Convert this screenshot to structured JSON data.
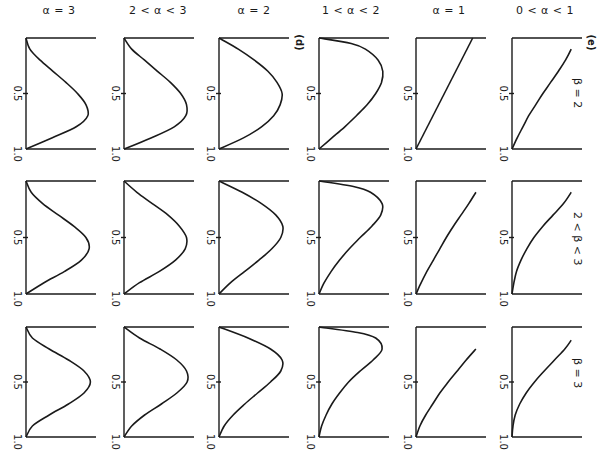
{
  "figure": {
    "panel_tags": {
      "d": "(d)",
      "e": "(e)"
    },
    "column_titles": [
      "α = 3",
      "2 < α < 3",
      "α = 2",
      "1 < α < 2",
      "α = 1",
      "0 < α < 1"
    ],
    "row_labels": [
      "β = 2",
      "2 < β < 3",
      "β = 3"
    ],
    "tick_labels": {
      "mid": "0.5",
      "end": "1.0"
    }
  },
  "chart_data": {
    "type": "line",
    "title": "",
    "xlabel": "",
    "ylabel": "",
    "axis_range": [
      0,
      1
    ],
    "axis_ticks": [
      0.5,
      1.0
    ],
    "grid": false,
    "columns": [
      "α = 3",
      "2 < α < 3",
      "α = 2",
      "1 < α < 2",
      "α = 1",
      "0 < α < 1"
    ],
    "rows": [
      "β = 2",
      "2 < β < 3",
      "β = 3"
    ],
    "panels": [
      {
        "row": "β = 2",
        "col": "α = 3",
        "t": [
          0,
          0.1,
          0.2,
          0.3,
          0.4,
          0.5,
          0.6,
          0.7,
          0.8,
          0.9,
          1.0
        ],
        "value": [
          0,
          0.06,
          0.22,
          0.42,
          0.62,
          0.8,
          0.93,
          0.96,
          0.78,
          0.4,
          0
        ]
      },
      {
        "row": "β = 2",
        "col": "2 < α < 3",
        "t": [
          0,
          0.1,
          0.2,
          0.3,
          0.4,
          0.5,
          0.6,
          0.7,
          0.8,
          0.9,
          1.0
        ],
        "value": [
          0,
          0.12,
          0.32,
          0.52,
          0.72,
          0.88,
          0.97,
          0.96,
          0.78,
          0.42,
          0
        ]
      },
      {
        "row": "β = 2",
        "col": "α = 2",
        "t": [
          0,
          0.1,
          0.2,
          0.3,
          0.4,
          0.5,
          0.6,
          0.7,
          0.8,
          0.9,
          1.0
        ],
        "value": [
          0,
          0.3,
          0.55,
          0.76,
          0.9,
          0.98,
          0.95,
          0.85,
          0.66,
          0.38,
          0
        ]
      },
      {
        "row": "β = 2",
        "col": "1 < α < 2",
        "t": [
          0,
          0.05,
          0.1,
          0.2,
          0.3,
          0.4,
          0.5,
          0.6,
          0.7,
          0.8,
          0.9,
          1.0
        ],
        "value": [
          0,
          0.5,
          0.72,
          0.92,
          0.99,
          0.97,
          0.88,
          0.75,
          0.58,
          0.4,
          0.2,
          0
        ]
      },
      {
        "row": "β = 2",
        "col": "α = 1",
        "t": [
          0,
          1.0
        ],
        "value": [
          0.88,
          0
        ]
      },
      {
        "row": "β = 2",
        "col": "0 < α < 1",
        "t": [
          0.1,
          0.2,
          0.3,
          0.4,
          0.5,
          0.6,
          0.7,
          0.8,
          0.9,
          1.0
        ],
        "value": [
          0.92,
          0.83,
          0.72,
          0.6,
          0.48,
          0.37,
          0.26,
          0.17,
          0.08,
          0
        ]
      },
      {
        "row": "2 < β < 3",
        "col": "α = 3",
        "t": [
          0,
          0.1,
          0.2,
          0.3,
          0.4,
          0.5,
          0.6,
          0.7,
          0.8,
          0.9,
          1.0
        ],
        "value": [
          0,
          0.08,
          0.26,
          0.5,
          0.74,
          0.93,
          0.98,
          0.86,
          0.6,
          0.28,
          0
        ]
      },
      {
        "row": "2 < β < 3",
        "col": "2 < α < 3",
        "t": [
          0,
          0.1,
          0.2,
          0.3,
          0.4,
          0.5,
          0.6,
          0.7,
          0.8,
          0.9,
          1.0
        ],
        "value": [
          0,
          0.2,
          0.44,
          0.68,
          0.86,
          0.97,
          0.95,
          0.8,
          0.55,
          0.24,
          0
        ]
      },
      {
        "row": "2 < β < 3",
        "col": "α = 2",
        "t": [
          0,
          0.1,
          0.2,
          0.3,
          0.4,
          0.5,
          0.6,
          0.7,
          0.8,
          0.9,
          1.0
        ],
        "value": [
          0,
          0.36,
          0.66,
          0.88,
          0.99,
          0.96,
          0.82,
          0.62,
          0.4,
          0.18,
          0
        ]
      },
      {
        "row": "2 < β < 3",
        "col": "1 < α < 2",
        "t": [
          0,
          0.05,
          0.1,
          0.2,
          0.3,
          0.4,
          0.5,
          0.6,
          0.7,
          0.8,
          0.9,
          1.0
        ],
        "value": [
          0,
          0.55,
          0.8,
          0.98,
          0.96,
          0.82,
          0.64,
          0.47,
          0.32,
          0.19,
          0.08,
          0
        ]
      },
      {
        "row": "2 < β < 3",
        "col": "α = 1",
        "t": [
          0.1,
          0.2,
          0.3,
          0.4,
          0.5,
          0.6,
          0.7,
          0.8,
          0.9,
          1.0
        ],
        "value": [
          0.93,
          0.82,
          0.7,
          0.58,
          0.47,
          0.37,
          0.27,
          0.17,
          0.08,
          0
        ]
      },
      {
        "row": "2 < β < 3",
        "col": "0 < α < 1",
        "t": [
          0.1,
          0.2,
          0.3,
          0.4,
          0.5,
          0.6,
          0.7,
          0.8,
          0.9,
          1.0
        ],
        "value": [
          0.92,
          0.8,
          0.64,
          0.48,
          0.34,
          0.23,
          0.14,
          0.07,
          0.03,
          0
        ]
      },
      {
        "row": "β = 3",
        "col": "α = 3",
        "t": [
          0,
          0.1,
          0.2,
          0.3,
          0.4,
          0.5,
          0.6,
          0.7,
          0.8,
          0.9,
          1.0
        ],
        "value": [
          0,
          0.1,
          0.36,
          0.66,
          0.9,
          1.0,
          0.9,
          0.66,
          0.36,
          0.1,
          0
        ]
      },
      {
        "row": "β = 3",
        "col": "2 < α < 3",
        "t": [
          0,
          0.1,
          0.2,
          0.3,
          0.4,
          0.5,
          0.6,
          0.7,
          0.8,
          0.9,
          1.0
        ],
        "value": [
          0,
          0.24,
          0.56,
          0.82,
          0.97,
          0.98,
          0.82,
          0.58,
          0.32,
          0.12,
          0
        ]
      },
      {
        "row": "β = 3",
        "col": "α = 2",
        "t": [
          0,
          0.1,
          0.2,
          0.3,
          0.4,
          0.5,
          0.6,
          0.7,
          0.8,
          0.9,
          1.0
        ],
        "value": [
          0,
          0.45,
          0.8,
          0.98,
          0.96,
          0.8,
          0.6,
          0.4,
          0.22,
          0.08,
          0
        ]
      },
      {
        "row": "β = 3",
        "col": "1 < α < 2",
        "t": [
          0,
          0.05,
          0.1,
          0.2,
          0.3,
          0.4,
          0.5,
          0.6,
          0.7,
          0.8,
          0.9,
          1.0
        ],
        "value": [
          0,
          0.6,
          0.88,
          0.98,
          0.84,
          0.64,
          0.46,
          0.32,
          0.2,
          0.11,
          0.04,
          0
        ]
      },
      {
        "row": "β = 3",
        "col": "α = 1",
        "t": [
          0.2,
          0.3,
          0.4,
          0.5,
          0.6,
          0.7,
          0.8,
          0.9,
          1.0
        ],
        "value": [
          0.93,
          0.78,
          0.64,
          0.5,
          0.37,
          0.26,
          0.15,
          0.06,
          0
        ]
      },
      {
        "row": "β = 3",
        "col": "0 < α < 1",
        "t": [
          0.12,
          0.2,
          0.3,
          0.4,
          0.5,
          0.6,
          0.7,
          0.8,
          0.9,
          1.0
        ],
        "value": [
          0.92,
          0.82,
          0.66,
          0.5,
          0.35,
          0.22,
          0.12,
          0.05,
          0.015,
          0
        ]
      }
    ]
  }
}
